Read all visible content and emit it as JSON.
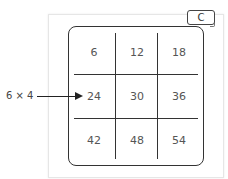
{
  "badge": {
    "label": "C"
  },
  "annotation": {
    "label": "6 × 4",
    "points_to": "24"
  },
  "grid": {
    "rows": [
      [
        "6",
        "12",
        "18"
      ],
      [
        "24",
        "30",
        "36"
      ],
      [
        "42",
        "48",
        "54"
      ]
    ]
  }
}
